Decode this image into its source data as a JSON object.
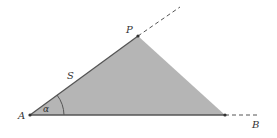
{
  "diagram": {
    "type": "geometry",
    "colors": {
      "fill": "#b5b5b5",
      "stroke": "#555555",
      "background": "#ffffff"
    },
    "points": {
      "A": {
        "label": "A",
        "x": 30,
        "y": 115
      },
      "P": {
        "label": "P",
        "x": 138,
        "y": 36
      },
      "C": {
        "label": "",
        "x": 225,
        "y": 115
      },
      "B": {
        "label": "B",
        "x": 255,
        "y": 115
      }
    },
    "labels": {
      "A": "A",
      "P": "P",
      "B": "B",
      "side": "S",
      "angle": "α"
    }
  }
}
